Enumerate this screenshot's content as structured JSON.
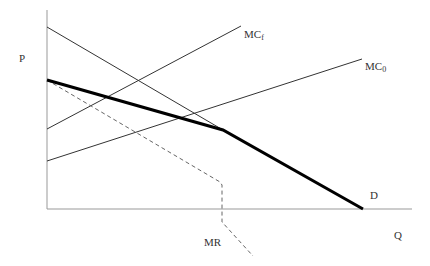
{
  "diagram": {
    "type": "economics-kinked-demand-mc",
    "axes": {
      "y_label": "P",
      "x_label": "Q",
      "origin": [
        47,
        209
      ],
      "y_top": [
        47,
        10
      ],
      "x_end": [
        412,
        209
      ]
    },
    "curves": [
      {
        "id": "mc-f",
        "label": "MC",
        "subscript": "f",
        "points": [
          [
            47,
            129
          ],
          [
            241,
            26
          ]
        ],
        "style": "thin"
      },
      {
        "id": "mc-0",
        "label": "MC",
        "subscript": "0",
        "points": [
          [
            47,
            161
          ],
          [
            362,
            59
          ]
        ],
        "style": "thin"
      },
      {
        "id": "demand-upper-thin",
        "label": "",
        "points": [
          [
            47,
            27
          ],
          [
            223,
            130
          ]
        ],
        "style": "thin"
      },
      {
        "id": "demand-kinked",
        "label": "D",
        "points": [
          [
            47,
            80
          ],
          [
            223,
            130
          ],
          [
            363,
            209
          ]
        ],
        "style": "thick"
      },
      {
        "id": "mr",
        "label": "MR",
        "points": [
          [
            47,
            80
          ],
          [
            220,
            182
          ],
          [
            222,
            184
          ],
          [
            222,
            222
          ],
          [
            253,
            256
          ]
        ],
        "style": "dashed"
      }
    ],
    "labels": {
      "p": "P",
      "q": "Q",
      "d": "D",
      "mr": "MR",
      "mc_f_main": "MC",
      "mc_f_sub": "f",
      "mc_0_main": "MC",
      "mc_0_sub": "0"
    },
    "colors": {
      "axis": "#888888",
      "line": "#333333",
      "thick": "#000000",
      "dashed": "#666666"
    }
  }
}
